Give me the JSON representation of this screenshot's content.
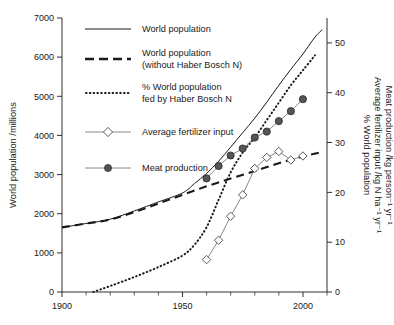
{
  "chart_data": {
    "type": "line",
    "title": "",
    "xlabel": "",
    "ylabel": "World population /millions",
    "ylabel_right_lines": [
      "% World population",
      "Average fertilizer input /kg N ha⁻¹ yr⁻¹",
      "Meat production /kg person⁻¹ yr⁻¹"
    ],
    "xlim": [
      1900,
      2010
    ],
    "ylim": [
      0,
      7000
    ],
    "ylim_right": [
      0,
      55
    ],
    "xticks": [
      1900,
      1950,
      2000
    ],
    "xticklabels": [
      "1900",
      "1950",
      "2000"
    ],
    "xticks_minor": [
      1910,
      1920,
      1930,
      1940,
      1960,
      1970,
      1980,
      1990,
      2010
    ],
    "yticks": [
      0,
      1000,
      2000,
      3000,
      4000,
      5000,
      6000,
      7000
    ],
    "yticklabels": [
      "0",
      "1000",
      "2000",
      "3000",
      "4000",
      "5000",
      "6000",
      "7000"
    ],
    "yticks_right": [
      0,
      10,
      20,
      30,
      40,
      50
    ],
    "yticklabels_right": [
      "0",
      "10",
      "20",
      "30",
      "40",
      "50"
    ],
    "grid": false,
    "legend_position": "upper-left-inside",
    "series": [
      {
        "name": "World population",
        "axis": "left",
        "style": "solid-thin",
        "marker": "none",
        "x": [
          1900,
          1910,
          1920,
          1930,
          1940,
          1950,
          1955,
          1960,
          1965,
          1970,
          1975,
          1980,
          1985,
          1990,
          1995,
          2000,
          2005,
          2008
        ],
        "values": [
          1650,
          1750,
          1860,
          2070,
          2300,
          2530,
          2770,
          3030,
          3340,
          3700,
          4070,
          4440,
          4850,
          5280,
          5690,
          6080,
          6510,
          6700
        ]
      },
      {
        "name": "World population (without Haber Bosch N)",
        "axis": "left",
        "style": "dashed-thick",
        "marker": "none",
        "x": [
          1900,
          1910,
          1920,
          1930,
          1940,
          1950,
          1960,
          1970,
          1980,
          1990,
          2000,
          2008
        ],
        "values": [
          1650,
          1750,
          1850,
          2040,
          2260,
          2480,
          2700,
          2900,
          3090,
          3290,
          3460,
          3580
        ]
      },
      {
        "name": "% World population fed by Haber Bosch N",
        "axis": "right",
        "style": "dotted",
        "marker": "none",
        "x": [
          1913,
          1920,
          1930,
          1940,
          1950,
          1955,
          1960,
          1965,
          1970,
          1975,
          1980,
          1985,
          1990,
          1995,
          2000,
          2005
        ],
        "values": [
          0.0,
          1.2,
          3.0,
          5.0,
          7.3,
          9.5,
          13.0,
          18.5,
          24.0,
          28.0,
          31.0,
          34.5,
          38.0,
          41.5,
          44.5,
          47.5
        ]
      },
      {
        "name": "Average fertilizer input",
        "axis": "right",
        "style": "solid-thin-grey",
        "marker": "open-diamond",
        "x": [
          1960,
          1965,
          1970,
          1975,
          1980,
          1985,
          1990,
          1995,
          2000
        ],
        "values": [
          6.5,
          10.4,
          15.2,
          19.5,
          24.8,
          27.0,
          28.2,
          26.5,
          27.3
        ]
      },
      {
        "name": "Meat production",
        "axis": "right",
        "style": "solid-thin-grey",
        "marker": "filled-circle",
        "x": [
          1960,
          1965,
          1970,
          1975,
          1980,
          1985,
          1990,
          1995,
          2000
        ],
        "values": [
          22.8,
          25.3,
          27.4,
          28.8,
          31.0,
          32.2,
          34.3,
          36.3,
          38.7
        ]
      }
    ]
  },
  "legend": {
    "items": [
      {
        "label_lines": [
          "World population"
        ],
        "style": "solid-thin",
        "marker": "none"
      },
      {
        "label_lines": [
          "World population",
          "(without Haber Bosch N)"
        ],
        "style": "dashed-thick",
        "marker": "none"
      },
      {
        "label_lines": [
          "% World population",
          "fed by Haber Bosch N"
        ],
        "style": "dotted",
        "marker": "none"
      },
      {
        "label_lines": [
          "Average fertilizer input"
        ],
        "style": "solid-thin-grey",
        "marker": "open-diamond"
      },
      {
        "label_lines": [
          "Meat production"
        ],
        "style": "solid-thin-grey",
        "marker": "filled-circle"
      }
    ]
  },
  "colors": {
    "axis": "#1a1a1a",
    "text": "#1a1a1a",
    "series_grey": "#7a7a7a",
    "marker_fill": "#555555",
    "background": "#ffffff"
  }
}
